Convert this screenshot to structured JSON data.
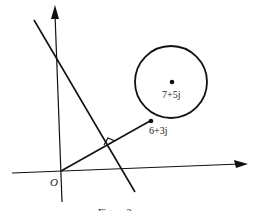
{
  "figure": {
    "origin_label": "O",
    "center_label": "7+5j",
    "point_label": "6+3j",
    "caption": "Figure 2",
    "colors": {
      "stroke": "#111111",
      "background": "#ffffff"
    }
  }
}
